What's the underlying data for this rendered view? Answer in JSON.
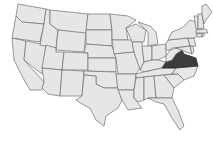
{
  "map": {
    "type": "us-states-locator",
    "region": "Contiguous United States",
    "highlighted_state": "Virginia",
    "colors": {
      "state_fill": "#e6e6e6",
      "state_border": "#6e6e6e",
      "highlight_fill": "#3c3c3c",
      "background": "#ffffff"
    }
  }
}
